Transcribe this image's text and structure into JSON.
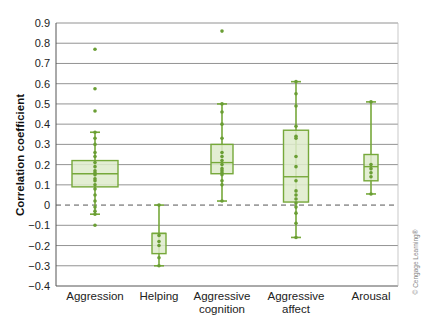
{
  "chart_data": {
    "type": "box",
    "title": "",
    "xlabel": "",
    "ylabel": "Correlation coefficient",
    "ylim": [
      -0.4,
      0.9
    ],
    "yticks": [
      0.9,
      0.8,
      0.7,
      0.6,
      0.5,
      0.4,
      0.3,
      0.2,
      0.1,
      0,
      -0.1,
      -0.2,
      -0.3,
      -0.4
    ],
    "ytick_labels": [
      "0.9",
      "0.8",
      "0.7",
      "0.6",
      "0.5",
      "0.4",
      "0.3",
      "0.2",
      "0.1",
      "0",
      "−0.1",
      "−0.2",
      "−0.3",
      "−0.4"
    ],
    "grid": true,
    "reference_line": {
      "y": 0,
      "style": "dashed"
    },
    "categories": [
      [
        "Aggression"
      ],
      [
        "Helping"
      ],
      [
        "Aggressive",
        "cognition"
      ],
      [
        "Aggressive",
        "affect"
      ],
      [
        "Arousal"
      ]
    ],
    "series": [
      {
        "name": "Aggression",
        "whisker_low": -0.045,
        "q1": 0.09,
        "median": 0.155,
        "q3": 0.22,
        "whisker_high": 0.36,
        "points": [
          0.77,
          0.575,
          0.465,
          0.36,
          0.33,
          0.3,
          0.26,
          0.24,
          0.21,
          0.19,
          0.17,
          0.16,
          0.15,
          0.13,
          0.12,
          0.1,
          0.08,
          0.05,
          0.02,
          -0.01,
          -0.03,
          -0.045,
          -0.1
        ]
      },
      {
        "name": "Helping",
        "whisker_low": -0.3,
        "q1": -0.24,
        "median": -0.14,
        "q3": -0.14,
        "whisker_high": 0.0,
        "points": [
          0.0,
          -0.15,
          -0.18,
          -0.2,
          -0.26,
          -0.3
        ]
      },
      {
        "name": "Aggressive cognition",
        "whisker_low": 0.02,
        "q1": 0.155,
        "median": 0.21,
        "q3": 0.3,
        "whisker_high": 0.5,
        "points": [
          0.86,
          0.5,
          0.46,
          0.4,
          0.33,
          0.26,
          0.24,
          0.22,
          0.2,
          0.18,
          0.17,
          0.16,
          0.15,
          0.12,
          0.1,
          0.02
        ]
      },
      {
        "name": "Aggressive affect",
        "whisker_low": -0.16,
        "q1": 0.015,
        "median": 0.14,
        "q3": 0.37,
        "whisker_high": 0.61,
        "points": [
          0.61,
          0.55,
          0.49,
          0.39,
          0.34,
          0.33,
          0.24,
          0.19,
          0.12,
          0.07,
          0.05,
          0.03,
          0.01,
          -0.01,
          -0.04,
          -0.09,
          -0.16
        ]
      },
      {
        "name": "Arousal",
        "whisker_low": 0.055,
        "q1": 0.12,
        "median": 0.19,
        "q3": 0.25,
        "whisker_high": 0.51,
        "points": [
          0.51,
          0.2,
          0.18,
          0.16,
          0.14,
          0.055
        ]
      }
    ],
    "colors": {
      "box_fill": "#deebcb",
      "stroke": "#76a83a",
      "point": "#6a9e34",
      "grid": "#777777",
      "zero_line": "#555555"
    },
    "annotations": [
      "© Cengage Learning®"
    ]
  }
}
